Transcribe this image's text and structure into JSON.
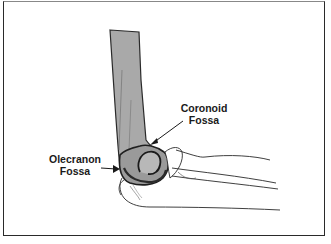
{
  "figure": {
    "type": "anatomical illustration",
    "colors": {
      "bone_fill": "#a9a9a9",
      "outline": "#2a2a2a",
      "frame": "#2a2a2a",
      "background": "#ffffff"
    },
    "labels": {
      "coronoid": {
        "line1": "Coronoid",
        "line2": "Fossa"
      },
      "olecranon": {
        "line1": "Olecranon",
        "line2": "Fossa"
      }
    }
  }
}
